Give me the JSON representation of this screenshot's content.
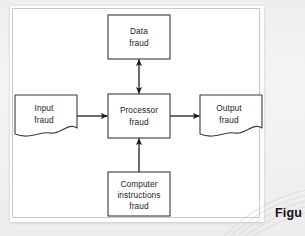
{
  "figure": {
    "caption": "Figu",
    "frame_color": "#c9c9c9",
    "line_color": "#1c1c1c",
    "paper_color": "#ffffff",
    "background_color": "#eeeeee"
  },
  "diagram": {
    "type": "flowchart",
    "nodes": [
      {
        "id": "data-fraud",
        "shape": "rectangle",
        "lines": [
          "Data",
          "fraud"
        ],
        "x": 98,
        "y": 9,
        "width": 62,
        "height": 44
      },
      {
        "id": "input-fraud",
        "shape": "document-flag",
        "lines": [
          "Input",
          "fraud"
        ],
        "x": 5,
        "y": 88,
        "width": 62,
        "height": 44
      },
      {
        "id": "processor-fraud",
        "shape": "rectangle",
        "lines": [
          "Processor",
          "fraud"
        ],
        "x": 98,
        "y": 88,
        "width": 62,
        "height": 44
      },
      {
        "id": "output-fraud",
        "shape": "document-flag",
        "lines": [
          "Output",
          "fraud"
        ],
        "x": 190,
        "y": 88,
        "width": 62,
        "height": 44
      },
      {
        "id": "computer-instructions-fraud",
        "shape": "rectangle",
        "lines": [
          "Computer",
          "instructions",
          "fraud"
        ],
        "x": 98,
        "y": 166,
        "width": 62,
        "height": 44
      }
    ],
    "edges": [
      {
        "id": "edge-processor-data",
        "from": "processor-fraud",
        "to": "data-fraud",
        "direction": "bidirectional",
        "orientation": "vertical"
      },
      {
        "id": "edge-input-processor",
        "from": "input-fraud",
        "to": "processor-fraud",
        "direction": "forward",
        "orientation": "horizontal"
      },
      {
        "id": "edge-processor-output",
        "from": "processor-fraud",
        "to": "output-fraud",
        "direction": "forward",
        "orientation": "horizontal"
      },
      {
        "id": "edge-instructions-processor",
        "from": "computer-instructions-fraud",
        "to": "processor-fraud",
        "direction": "forward",
        "orientation": "vertical"
      }
    ]
  }
}
